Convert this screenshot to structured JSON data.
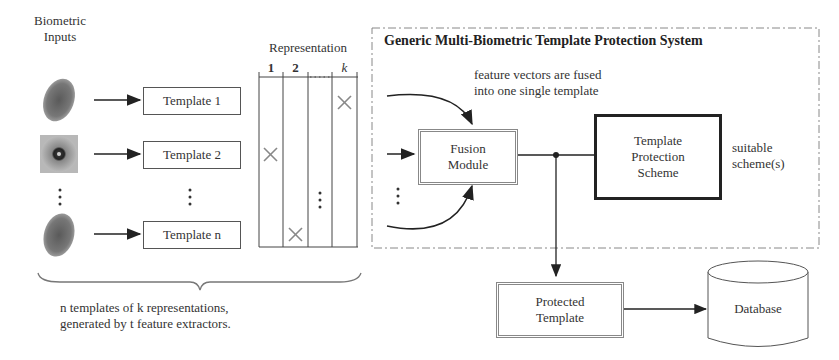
{
  "inputs": {
    "heading_line1": "Biometric",
    "heading_line2": "Inputs",
    "items": [
      {
        "icon": "fingerprint-icon",
        "template": "Template 1"
      },
      {
        "icon": "iris-icon",
        "template": "Template 2"
      },
      {
        "icon": "fingerprint-icon",
        "template": "Template n"
      }
    ],
    "ellipsis": "⋮"
  },
  "representation": {
    "heading": "Representation",
    "columns": [
      "1",
      "2",
      "…",
      "k"
    ],
    "marks": [
      {
        "column": "k",
        "row": 1
      },
      {
        "column": "1",
        "row": 2
      },
      {
        "column": "2",
        "row": 3
      }
    ]
  },
  "brace_caption": {
    "line1": "n templates of k representations,",
    "line2": "generated by t feature extractors."
  },
  "system": {
    "title": "Generic Multi-Biometric Template Protection System",
    "fusion_note_line1": "feature vectors are fused",
    "fusion_note_line2": "into one single template",
    "fusion_module_line1": "Fusion",
    "fusion_module_line2": "Module",
    "tps_line1": "Template",
    "tps_line2": "Protection",
    "tps_line3": "Scheme",
    "suitable_line1": "suitable",
    "suitable_line2": "scheme(s)"
  },
  "output": {
    "protected_line1": "Protected",
    "protected_line2": "Template",
    "database": "Database"
  },
  "colors": {
    "line": "#333333",
    "double_border": "#888888",
    "dash_border": "#888888"
  }
}
